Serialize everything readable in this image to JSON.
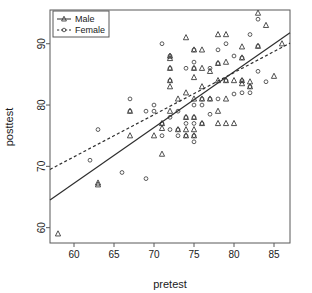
{
  "chart_data": {
    "type": "scatter",
    "title": "",
    "xlabel": "pretest",
    "ylabel": "posttest",
    "xlim": [
      57.0,
      87.0
    ],
    "ylim": [
      57.5,
      95.5
    ],
    "xticks": [
      60,
      65,
      70,
      75,
      80,
      85
    ],
    "yticks": [
      60,
      70,
      80,
      90
    ],
    "grid": false,
    "frame": true,
    "legend": {
      "position": "top-left",
      "entries": [
        {
          "name": "Male",
          "marker": "triangle",
          "line": "solid",
          "color": "#3c3c3c"
        },
        {
          "name": "Female",
          "marker": "circle",
          "line": "dashed",
          "color": "#3c3c3c"
        }
      ]
    },
    "series": [
      {
        "name": "Male",
        "marker": "triangle",
        "color": "#3c3c3c",
        "points": [
          [
            58,
            59
          ],
          [
            63,
            67
          ],
          [
            63,
            67.3
          ],
          [
            67,
            79
          ],
          [
            67,
            75
          ],
          [
            70,
            75
          ],
          [
            71,
            72
          ],
          [
            71,
            77
          ],
          [
            71,
            76.2
          ],
          [
            72,
            83
          ],
          [
            72,
            84
          ],
          [
            72,
            87.6
          ],
          [
            72,
            86
          ],
          [
            72,
            88
          ],
          [
            72,
            79
          ],
          [
            73,
            76
          ],
          [
            73,
            81
          ],
          [
            74,
            91
          ],
          [
            74,
            82
          ],
          [
            74,
            78
          ],
          [
            74,
            76
          ],
          [
            74,
            75
          ],
          [
            75,
            89
          ],
          [
            75,
            86
          ],
          [
            75,
            84.5
          ],
          [
            75,
            81
          ],
          [
            75,
            78
          ],
          [
            75,
            76
          ],
          [
            75,
            75
          ],
          [
            76,
            89
          ],
          [
            76,
            86
          ],
          [
            76,
            83
          ],
          [
            76,
            81
          ],
          [
            76,
            77
          ],
          [
            77,
            85.5
          ],
          [
            77,
            81
          ],
          [
            78,
            91.5
          ],
          [
            78,
            86.8
          ],
          [
            78,
            84
          ],
          [
            78,
            79
          ],
          [
            78,
            77
          ],
          [
            79,
            91.5
          ],
          [
            79,
            87
          ],
          [
            79,
            84
          ],
          [
            79,
            81
          ],
          [
            79,
            77
          ],
          [
            80,
            84
          ],
          [
            80,
            77
          ],
          [
            81,
            89.5
          ],
          [
            81,
            87.7
          ],
          [
            81,
            84
          ],
          [
            81,
            83.5
          ],
          [
            82,
            83.8
          ],
          [
            82,
            83
          ],
          [
            83,
            89.6
          ],
          [
            83,
            95
          ],
          [
            84,
            93
          ],
          [
            85,
            84.7
          ],
          [
            86,
            90
          ]
        ]
      },
      {
        "name": "Female",
        "marker": "circle",
        "color": "#4a4a4a",
        "points": [
          [
            62,
            71
          ],
          [
            63,
            76
          ],
          [
            66,
            69
          ],
          [
            67,
            81
          ],
          [
            67,
            79
          ],
          [
            69,
            68
          ],
          [
            69,
            79
          ],
          [
            70,
            80
          ],
          [
            70,
            79
          ],
          [
            71,
            90
          ],
          [
            71,
            77
          ],
          [
            71,
            75
          ],
          [
            72,
            88
          ],
          [
            72,
            86
          ],
          [
            72,
            84
          ],
          [
            72,
            78
          ],
          [
            72,
            76
          ],
          [
            73,
            79
          ],
          [
            73,
            76
          ],
          [
            73,
            75
          ],
          [
            74,
            86
          ],
          [
            74,
            78
          ],
          [
            74,
            77
          ],
          [
            74,
            75
          ],
          [
            75,
            89
          ],
          [
            75,
            87
          ],
          [
            75,
            86
          ],
          [
            75,
            80
          ],
          [
            75,
            78
          ],
          [
            75,
            77
          ],
          [
            75,
            75
          ],
          [
            75,
            74
          ],
          [
            76,
            81
          ],
          [
            76,
            80
          ],
          [
            76,
            77
          ],
          [
            77,
            86
          ],
          [
            77,
            81
          ],
          [
            77,
            78.5
          ],
          [
            78,
            89
          ],
          [
            78,
            86.8
          ],
          [
            78,
            81
          ],
          [
            79,
            90
          ],
          [
            79,
            84
          ],
          [
            80,
            88
          ],
          [
            80,
            81.8
          ],
          [
            81,
            87.7
          ],
          [
            81,
            84
          ],
          [
            81,
            82
          ],
          [
            82,
            91.5
          ],
          [
            82,
            83
          ],
          [
            82,
            82
          ],
          [
            83,
            94
          ],
          [
            83,
            89.6
          ],
          [
            83,
            85.5
          ],
          [
            84,
            83.8
          ]
        ]
      }
    ],
    "fit_lines": [
      {
        "name": "Male",
        "style": "solid",
        "x0": 57.0,
        "y0": 64.5,
        "x1": 87.0,
        "y1": 91.8,
        "color": "#2e2e2e"
      },
      {
        "name": "Female",
        "style": "dashed",
        "x0": 57.0,
        "y0": 69.5,
        "x1": 87.0,
        "y1": 90.1,
        "color": "#2e2e2e"
      }
    ]
  },
  "axes": {
    "xlabel": "pretest",
    "ylabel": "posttest",
    "xtick_labels": [
      "60",
      "65",
      "70",
      "75",
      "80",
      "85"
    ],
    "ytick_labels": [
      "60",
      "70",
      "80",
      "90"
    ]
  },
  "legend": {
    "male_label": "Male",
    "female_label": "Female"
  }
}
